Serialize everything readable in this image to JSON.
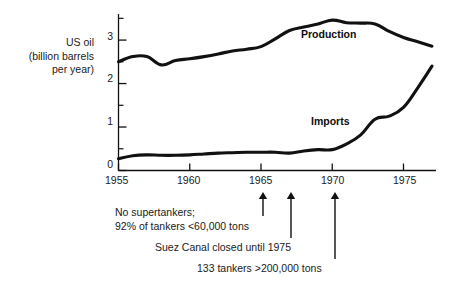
{
  "figure": {
    "background": "#ffffff",
    "ink_color": "#111111"
  },
  "chart_data": {
    "type": "line",
    "title": "",
    "subtitle": "",
    "xlabel": "",
    "ylabel": "US oil (billion barrels per year)",
    "ylabel_lines": [
      "US oil",
      "(billion barrels",
      "per year)"
    ],
    "xlim": [
      1955,
      1977
    ],
    "ylim": [
      0,
      3.6
    ],
    "grid": false,
    "legend_position": "inline-labels",
    "x_ticks": [
      1955,
      1960,
      1965,
      1970,
      1975
    ],
    "x_tick_labels": [
      "1955",
      "1960",
      "1965",
      "1970",
      "1975"
    ],
    "x_minor_ticks": [],
    "y_ticks": [
      0,
      1,
      2,
      3
    ],
    "y_tick_labels": [
      "0",
      "1",
      "2",
      "3"
    ],
    "y_minor_ticks": [
      0.5,
      1.5,
      2.5,
      3.5
    ],
    "x": [
      1955,
      1956,
      1957,
      1958,
      1959,
      1960,
      1961,
      1962,
      1963,
      1964,
      1965,
      1966,
      1967,
      1968,
      1969,
      1970,
      1971,
      1972,
      1973,
      1974,
      1975,
      1976,
      1977
    ],
    "series": [
      {
        "name": "Production",
        "label": "Production",
        "color": "#111111",
        "values": [
          2.5,
          2.62,
          2.62,
          2.43,
          2.53,
          2.57,
          2.62,
          2.68,
          2.75,
          2.79,
          2.85,
          3.03,
          3.22,
          3.3,
          3.37,
          3.46,
          3.4,
          3.39,
          3.37,
          3.2,
          3.06,
          2.96,
          2.86
        ]
      },
      {
        "name": "Imports",
        "label": "Imports",
        "color": "#111111",
        "values": [
          0.27,
          0.34,
          0.36,
          0.35,
          0.35,
          0.36,
          0.38,
          0.4,
          0.41,
          0.42,
          0.42,
          0.42,
          0.4,
          0.45,
          0.48,
          0.48,
          0.61,
          0.82,
          1.18,
          1.25,
          1.45,
          1.9,
          2.4
        ]
      }
    ],
    "annotations": [
      {
        "id": "no-supertankers",
        "text_lines": [
          "No supertankers;",
          "92% of tankers <60,000 tons"
        ],
        "arrow_year": 1965,
        "align": "left"
      },
      {
        "id": "suez-canal",
        "text_lines": [
          "Suez Canal closed until 1975"
        ],
        "arrow_year": 1967,
        "align": "left"
      },
      {
        "id": "large-tankers",
        "text_lines": [
          "133 tankers >200,000 tons"
        ],
        "arrow_year": 1970,
        "align": "left"
      }
    ]
  },
  "layout": {
    "ylabel_lines_pos": [
      {
        "text": "US oil",
        "right": 94,
        "top": 36
      },
      {
        "text": "(billion barrels",
        "right": 94,
        "top": 49.5
      },
      {
        "text": "per year)",
        "right": 94,
        "top": 63
      }
    ],
    "y_tick_label_pos": [
      {
        "text": "3",
        "right": 113,
        "top": 30
      },
      {
        "text": "2",
        "right": 113,
        "top": 72
      },
      {
        "text": "1",
        "right": 113,
        "top": 115
      },
      {
        "text": "0",
        "right": 113,
        "top": 158
      }
    ],
    "x_tick_label_pos": [
      {
        "text": "1955",
        "left": 105,
        "top": 174
      },
      {
        "text": "1960",
        "left": 177,
        "top": 174
      },
      {
        "text": "1965",
        "left": 249,
        "top": 174
      },
      {
        "text": "1970",
        "left": 321,
        "top": 174
      },
      {
        "text": "1975",
        "left": 393,
        "top": 174
      }
    ],
    "series_label_pos": [
      {
        "text": "Production",
        "left": 301,
        "top": 28
      },
      {
        "text": "Imports",
        "left": 311,
        "top": 115
      }
    ],
    "annotation_text_pos": [
      {
        "text": "No supertankers;",
        "left": 115,
        "top": 205
      },
      {
        "text": "92% of tankers <60,000 tons",
        "left": 115,
        "top": 219
      },
      {
        "text": "Suez Canal closed until 1975",
        "left": 155,
        "top": 240
      },
      {
        "text": "133 tankers >200,000 tons",
        "left": 197,
        "top": 261
      }
    ],
    "arrows": [
      {
        "id": "arrow-1965",
        "x": 263,
        "y_tail": 216,
        "y_head": 192
      },
      {
        "id": "arrow-1967",
        "x": 291,
        "y_tail": 238,
        "y_head": 192
      },
      {
        "id": "arrow-1970",
        "x": 335,
        "y_tail": 259,
        "y_head": 192
      }
    ]
  }
}
